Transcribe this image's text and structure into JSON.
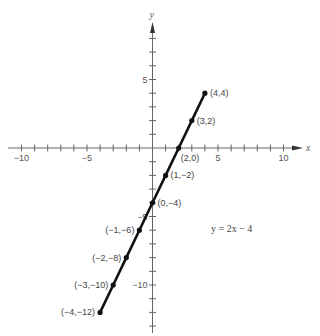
{
  "chart_data": {
    "type": "line",
    "title": "",
    "xlabel": "x",
    "ylabel": "y",
    "xlim": [
      -11,
      11
    ],
    "ylim": [
      -14,
      10
    ],
    "grid": false,
    "x_ticks": [
      -10,
      -9,
      -8,
      -7,
      -6,
      -5,
      -4,
      -3,
      -2,
      -1,
      1,
      2,
      3,
      4,
      5,
      6,
      7,
      8,
      9,
      10
    ],
    "y_ticks": [
      -13,
      -12,
      -11,
      -10,
      -9,
      -8,
      -7,
      -6,
      -5,
      -4,
      -3,
      -2,
      -1,
      1,
      2,
      3,
      4,
      5,
      6,
      7,
      8
    ],
    "x_tick_labels": [
      {
        "value": -10,
        "label": "−10"
      },
      {
        "value": -5,
        "label": "−5"
      },
      {
        "value": 5,
        "label": "5"
      },
      {
        "value": 10,
        "label": "10"
      }
    ],
    "y_tick_labels": [
      {
        "value": 5,
        "label": "5"
      },
      {
        "value": -5,
        "label": "−5"
      },
      {
        "value": -10,
        "label": "−10"
      }
    ],
    "series": [
      {
        "name": "y = 2x − 4",
        "x": [
          -4,
          -3,
          -2,
          -1,
          0,
          1,
          2,
          3,
          4
        ],
        "y": [
          -12,
          -10,
          -8,
          -6,
          -4,
          -2,
          0,
          2,
          4
        ]
      }
    ],
    "point_labels": [
      {
        "x": 4,
        "y": 4,
        "label": "(4,4)",
        "side": "right"
      },
      {
        "x": 3,
        "y": 2,
        "label": "(3,2)",
        "side": "right"
      },
      {
        "x": 2,
        "y": 0,
        "label": "(2,0)",
        "side": "below-right"
      },
      {
        "x": 1,
        "y": -2,
        "label": "(1,−2)",
        "side": "right"
      },
      {
        "x": 0,
        "y": -4,
        "label": "(0,−4)",
        "side": "right"
      },
      {
        "x": -1,
        "y": -6,
        "label": "(−1,−6)",
        "side": "left"
      },
      {
        "x": -2,
        "y": -8,
        "label": "(−2,−8)",
        "side": "left"
      },
      {
        "x": -3,
        "y": -10,
        "label": "(−3,−10)",
        "side": "left"
      },
      {
        "x": -4,
        "y": -12,
        "label": "(−4,−12)",
        "side": "left"
      }
    ],
    "annotations": [
      {
        "text": "y = 2x − 4",
        "x": 5,
        "y": -6
      }
    ]
  },
  "colors": {
    "axis": "#666666",
    "line": "#111111",
    "text": "#444444"
  }
}
